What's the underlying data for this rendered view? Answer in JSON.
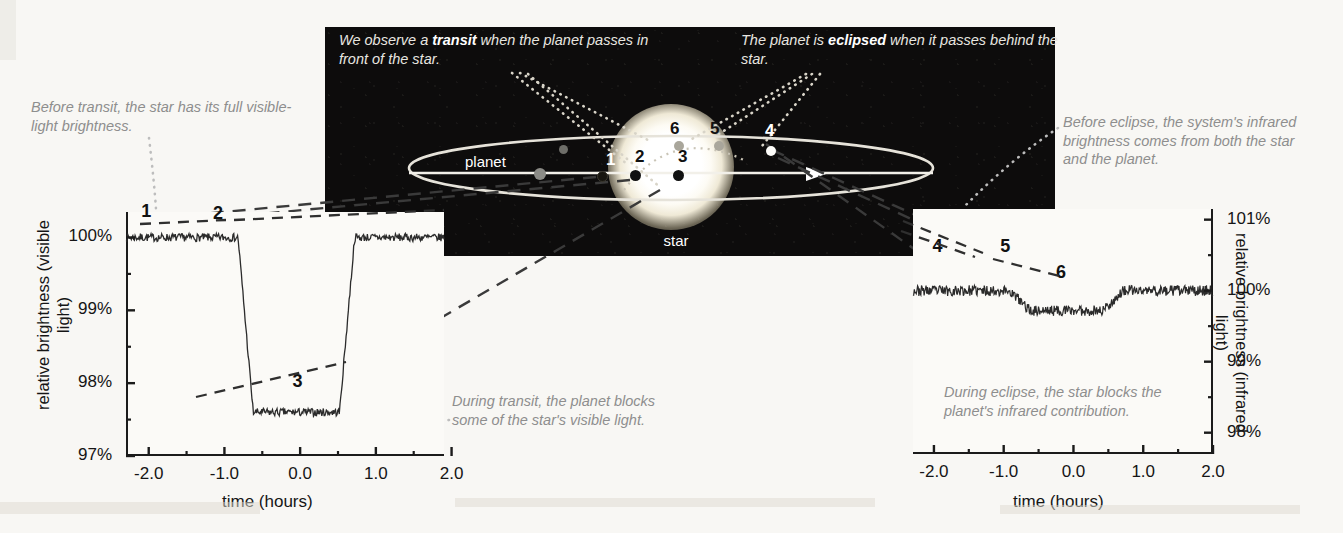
{
  "diagram": {
    "title_captions": {
      "transit_pre": "We observe a ",
      "transit_bold": "transit",
      "transit_post": " when the planet passes in front of the star.",
      "eclipse_pre": "The planet is ",
      "eclipse_bold": "eclipsed",
      "eclipse_post": " when it passes behind the star."
    },
    "star_label": "star",
    "planet_label": "planet",
    "positions": [
      {
        "id": "1",
        "kind": "front"
      },
      {
        "id": "2",
        "kind": "front"
      },
      {
        "id": "3",
        "kind": "front"
      },
      {
        "id": "4",
        "kind": "behind"
      },
      {
        "id": "5",
        "kind": "behind"
      },
      {
        "id": "6",
        "kind": "behind"
      }
    ]
  },
  "notes": {
    "before_transit": "Before transit, the star has its full visible-light brightness.",
    "during_transit": "During transit, the planet blocks some of the star's visible light.",
    "before_eclipse": "Before eclipse, the system's infrared brightness comes from both the star and the planet.",
    "during_eclipse": "During eclipse, the star blocks the planet's infrared contribution."
  },
  "chart_data": [
    {
      "type": "line",
      "name": "transit-light-curve",
      "title": "",
      "xlabel": "time (hours)",
      "ylabel": "relative brightness (visible light)",
      "xlim": [
        -2.3,
        1.9
      ],
      "ylim": [
        97,
        100.35
      ],
      "xticks": [
        "-2.0",
        "-1.0",
        "0.0",
        "1.0",
        "2.0"
      ],
      "xtick_values": [
        -2.0,
        -1.0,
        0.0,
        1.0,
        2.0
      ],
      "yticks": [
        "100%",
        "99%",
        "98%",
        "97%"
      ],
      "ytick_values": [
        100,
        99,
        98,
        97
      ],
      "grid": false,
      "baseline": 100.0,
      "depth_percent": 2.4,
      "floor": 97.6,
      "ingress_start": -0.82,
      "ingress_end": -0.62,
      "egress_start": 0.52,
      "egress_end": 0.72,
      "labels": [
        {
          "text": "1",
          "x": -2.1,
          "y": 100.28
        },
        {
          "text": "2",
          "x": -1.15,
          "y": 100.25
        },
        {
          "text": "3",
          "x": -0.1,
          "y": 97.95
        }
      ]
    },
    {
      "type": "line",
      "name": "eclipse-light-curve",
      "title": "",
      "xlabel": "time (hours)",
      "ylabel": "relative brightness (infrared light)",
      "xlim": [
        -2.3,
        2.0
      ],
      "ylim": [
        97.7,
        101.15
      ],
      "xticks": [
        "-2.0",
        "-1.0",
        "0.0",
        "1.0",
        "2.0"
      ],
      "xtick_values": [
        -2.0,
        -1.0,
        0.0,
        1.0,
        2.0
      ],
      "yticks": [
        "101%",
        "100%",
        "99%",
        "98%"
      ],
      "ytick_values": [
        101,
        100,
        99,
        98
      ],
      "grid": false,
      "baseline": 100.0,
      "depth_percent": 0.28,
      "floor": 99.72,
      "ingress_start": -0.92,
      "ingress_end": -0.62,
      "egress_start": 0.42,
      "egress_end": 0.72,
      "labels": [
        {
          "text": "4",
          "x": -2.02,
          "y": 100.55
        },
        {
          "text": "5",
          "x": -1.05,
          "y": 100.55
        },
        {
          "text": "6",
          "x": -0.25,
          "y": 100.18
        }
      ]
    }
  ],
  "colors": {
    "sky": "#0d0c0c",
    "star": "#ffffff",
    "note_text": "#8e8e8e",
    "axis": "#1b1b1b",
    "page": "#f8f7f4"
  }
}
